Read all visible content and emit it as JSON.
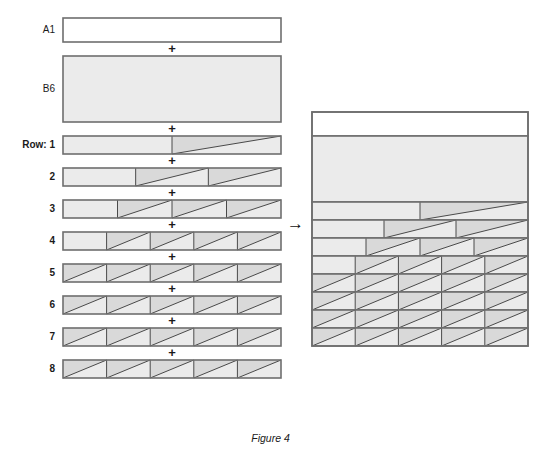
{
  "figure": {
    "caption": "Figure 4",
    "operator_symbol": "+",
    "arrow_symbol": "→",
    "colors": {
      "stroke": "#6e6e6e",
      "stroke_dark": "#4a4a4a",
      "fill_light": "#ebebeb",
      "fill_mid": "#d8d8d8",
      "fill_white": "#ffffff",
      "text": "#1a1a1a"
    }
  },
  "left_stack": {
    "bars": [
      {
        "label": "A1",
        "label_bold": false,
        "fill": "white",
        "cells": 1,
        "diagonal_cells": 0,
        "height": 24
      },
      {
        "label": "B6",
        "label_bold": false,
        "fill": "light",
        "cells": 1,
        "diagonal_cells": 0,
        "height": 66
      },
      {
        "label": "Row: 1",
        "label_bold": true,
        "fill": "light",
        "cells": 2,
        "diagonal_cells": 1,
        "height": 18
      },
      {
        "label": "2",
        "label_bold": true,
        "fill": "light",
        "cells": 3,
        "diagonal_cells": 2,
        "height": 18
      },
      {
        "label": "3",
        "label_bold": true,
        "fill": "light",
        "cells": 4,
        "diagonal_cells": 3,
        "height": 18
      },
      {
        "label": "4",
        "label_bold": true,
        "fill": "light",
        "cells": 5,
        "diagonal_cells": 4,
        "height": 18
      },
      {
        "label": "5",
        "label_bold": true,
        "fill": "light",
        "cells": 5,
        "diagonal_cells": 5,
        "height": 18
      },
      {
        "label": "6",
        "label_bold": true,
        "fill": "light",
        "cells": 5,
        "diagonal_cells": 5,
        "height": 18
      },
      {
        "label": "7",
        "label_bold": true,
        "fill": "light",
        "cells": 5,
        "diagonal_cells": 5,
        "height": 18
      },
      {
        "label": "8",
        "label_bold": true,
        "fill": "light",
        "cells": 5,
        "diagonal_cells": 5,
        "height": 18
      }
    ],
    "operators": [
      "+",
      "+",
      "+",
      "+",
      "+",
      "+",
      "+",
      "+",
      "+"
    ]
  },
  "right_composite": {
    "description": "stacked-result-block",
    "bands": [
      {
        "source": "A1",
        "fill": "white",
        "cells": 1,
        "diagonal_cells": 0
      },
      {
        "source": "B6",
        "fill": "light",
        "cells": 1,
        "diagonal_cells": 0
      },
      {
        "source": "Row: 1",
        "fill": "light",
        "cells": 2,
        "diagonal_cells": 1
      },
      {
        "source": "2",
        "fill": "light",
        "cells": 3,
        "diagonal_cells": 2
      },
      {
        "source": "3",
        "fill": "light",
        "cells": 4,
        "diagonal_cells": 3
      },
      {
        "source": "4",
        "fill": "light",
        "cells": 5,
        "diagonal_cells": 4
      },
      {
        "source": "5",
        "fill": "light",
        "cells": 5,
        "diagonal_cells": 5
      },
      {
        "source": "6",
        "fill": "light",
        "cells": 5,
        "diagonal_cells": 5
      },
      {
        "source": "7",
        "fill": "light",
        "cells": 5,
        "diagonal_cells": 5
      },
      {
        "source": "8",
        "fill": "light",
        "cells": 5,
        "diagonal_cells": 5
      }
    ]
  }
}
